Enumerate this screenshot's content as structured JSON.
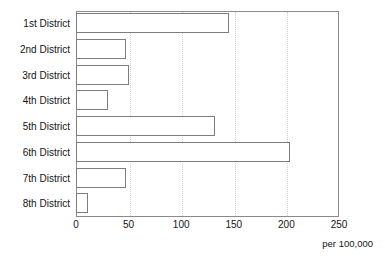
{
  "chart_data": {
    "type": "bar",
    "orientation": "horizontal",
    "title": "",
    "subtitle": "",
    "xlabel": "",
    "ylabel": "",
    "unit_caption": "per 100,000",
    "categories": [
      "1st District",
      "2nd District",
      "3rd District",
      "4th District",
      "5th District",
      "6th District",
      "7th District",
      "8th District"
    ],
    "values": [
      145,
      48,
      50,
      30,
      132,
      203,
      48,
      11
    ],
    "xlim": [
      0,
      250
    ],
    "xticks": [
      0,
      50,
      100,
      150,
      200,
      250
    ],
    "xtick_labels": [
      "0",
      "50",
      "100",
      "150",
      "200",
      "250"
    ],
    "grid": "vertical-dotted",
    "legend": "none",
    "colors": {
      "bar_fill": "#ffffff",
      "bar_stroke": "#7d7d7d",
      "axis": "#8a8a8a",
      "gridline": "#d2d2d2",
      "text": "#141414"
    }
  }
}
